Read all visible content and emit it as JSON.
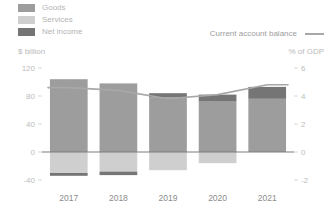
{
  "legend": {
    "categories": [
      {
        "label": "Goods",
        "color": "#9d9d9d",
        "key": "goods"
      },
      {
        "label": "Services",
        "color": "#cfcfcf",
        "key": "services"
      },
      {
        "label": "Net income",
        "color": "#757575",
        "key": "net_income"
      }
    ],
    "line": {
      "label": "Current account balance",
      "color": "#a8a8a8"
    }
  },
  "axes": {
    "left_unit": "$ billion",
    "right_unit": "% of GDP"
  },
  "chart_data": {
    "type": "bar",
    "title": "",
    "subtitle": "",
    "xlabel": "",
    "ylabel": "$ billion",
    "y2label": "% of GDP",
    "grid": false,
    "legend_position": "top-left",
    "categories": [
      "2017",
      "2018",
      "2019",
      "2020",
      "2021"
    ],
    "ylim": [
      -40,
      120
    ],
    "yticks": [
      120,
      80,
      40,
      0,
      -40
    ],
    "ytick_labels": [
      "120",
      "80",
      "40",
      "0",
      "-40"
    ],
    "y2lim": [
      -2,
      6
    ],
    "y2ticks": [
      6,
      4,
      2,
      0,
      -2
    ],
    "y2tick_labels": [
      "6",
      "4",
      "2",
      "0",
      "-2"
    ],
    "stacked": true,
    "series": [
      {
        "name": "Goods",
        "axis": "left",
        "type": "bar",
        "color": "#9d9d9d",
        "values": [
          104,
          98,
          78,
          72,
          76
        ]
      },
      {
        "name": "Services",
        "axis": "left",
        "type": "bar",
        "color": "#cfcfcf",
        "values": [
          -30,
          -28,
          -26,
          -16,
          0
        ]
      },
      {
        "name": "Net income",
        "axis": "left",
        "type": "bar",
        "color": "#757575",
        "values": [
          -4,
          -5,
          6,
          10,
          17
        ]
      },
      {
        "name": "Current account balance",
        "axis": "right",
        "type": "line",
        "color": "#a8a8a8",
        "values": [
          4.6,
          4.4,
          3.8,
          4.1,
          4.8
        ]
      }
    ]
  }
}
